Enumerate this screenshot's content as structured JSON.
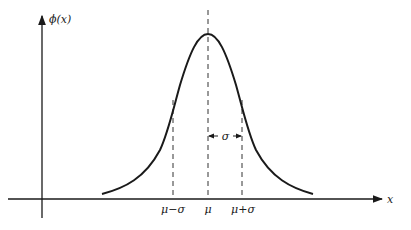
{
  "figure": {
    "y_axis_label": "ϕ(x)",
    "x_axis_label": "x",
    "ticks": {
      "mu_minus_sigma": "μ−σ",
      "mu": "μ",
      "mu_plus_sigma": "μ+σ"
    },
    "sigma_label": "σ",
    "colors": {
      "line": "#1a1a1a",
      "background": "#ffffff"
    }
  }
}
